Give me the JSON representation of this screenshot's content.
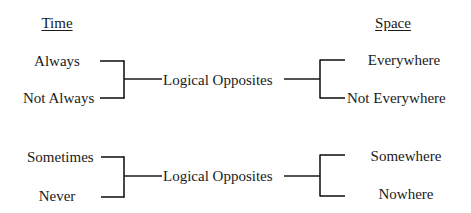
{
  "headers": {
    "left": "Time",
    "right": "Space"
  },
  "groups": [
    {
      "time_terms": [
        "Always",
        "Not Always"
      ],
      "relation": "Logical Opposites",
      "space_terms": [
        "Everywhere",
        "Not Everywhere"
      ]
    },
    {
      "time_terms": [
        "Sometimes",
        "Never"
      ],
      "relation": "Logical Opposites",
      "space_terms": [
        "Somewhere",
        "Nowhere"
      ]
    }
  ]
}
